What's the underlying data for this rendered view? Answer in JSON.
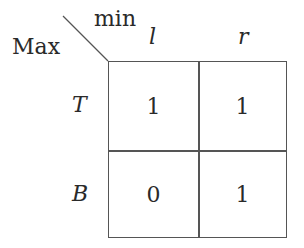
{
  "header": {
    "row_player_label": "Max",
    "col_player_label": "min"
  },
  "columns": [
    "l",
    "r"
  ],
  "rows": [
    {
      "label": "T",
      "values": [
        "1",
        "1"
      ]
    },
    {
      "label": "B",
      "values": [
        "0",
        "1"
      ]
    }
  ]
}
